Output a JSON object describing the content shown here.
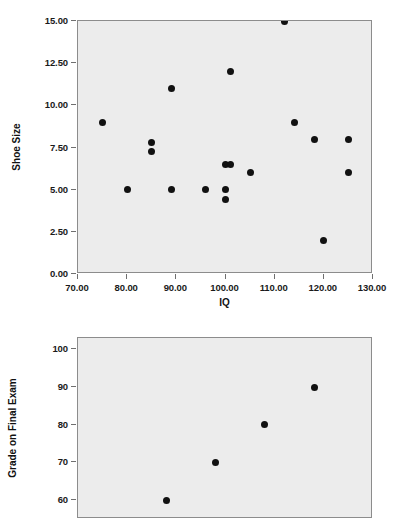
{
  "chart_data": [
    {
      "type": "scatter",
      "name": "shoe-size-vs-iq",
      "title": "",
      "xlabel": "IQ",
      "ylabel": "Shoe Size",
      "xlim": [
        70,
        130
      ],
      "ylim": [
        0,
        15
      ],
      "xticks": [
        "70.00",
        "80.00",
        "90.00",
        "100.00",
        "110.00",
        "120.00",
        "130.00"
      ],
      "xtick_values": [
        70,
        80,
        90,
        100,
        110,
        120,
        130
      ],
      "yticks": [
        "0.00",
        "2.50",
        "5.00",
        "7.50",
        "10.00",
        "12.50",
        "15.00"
      ],
      "ytick_values": [
        0,
        2.5,
        5,
        7.5,
        10,
        12.5,
        15
      ],
      "grid": false,
      "legend": "none",
      "marker_color": "#111111",
      "plot_background": "#ececec",
      "points": [
        {
          "x": 75,
          "y": 9.0
        },
        {
          "x": 80,
          "y": 5.0
        },
        {
          "x": 85,
          "y": 7.8
        },
        {
          "x": 85,
          "y": 7.25
        },
        {
          "x": 89,
          "y": 11.0
        },
        {
          "x": 89,
          "y": 5.0
        },
        {
          "x": 96,
          "y": 5.0
        },
        {
          "x": 100,
          "y": 6.5
        },
        {
          "x": 100,
          "y": 5.0
        },
        {
          "x": 100,
          "y": 4.4
        },
        {
          "x": 101,
          "y": 12.0
        },
        {
          "x": 101,
          "y": 6.5
        },
        {
          "x": 105,
          "y": 6.0
        },
        {
          "x": 112,
          "y": 15.0
        },
        {
          "x": 114,
          "y": 9.0
        },
        {
          "x": 118,
          "y": 8.0
        },
        {
          "x": 120,
          "y": 2.0
        },
        {
          "x": 125,
          "y": 8.0
        },
        {
          "x": 125,
          "y": 6.0
        }
      ]
    },
    {
      "type": "scatter",
      "name": "grade-on-final-exam",
      "title": "",
      "xlabel": "",
      "ylabel": "Grade on Final Exam",
      "xlim": [
        70,
        130
      ],
      "ylim": [
        55,
        103
      ],
      "xticks": [],
      "xtick_values": [],
      "yticks": [
        "60",
        "70",
        "80",
        "90",
        "100"
      ],
      "ytick_values": [
        60,
        70,
        80,
        90,
        100
      ],
      "grid": false,
      "legend": "none",
      "marker_color": "#111111",
      "plot_background": "#ececec",
      "clipped_bottom": true,
      "points": [
        {
          "x": 88,
          "y": 60
        },
        {
          "x": 98,
          "y": 70
        },
        {
          "x": 108,
          "y": 80
        },
        {
          "x": 118,
          "y": 90
        }
      ]
    }
  ]
}
